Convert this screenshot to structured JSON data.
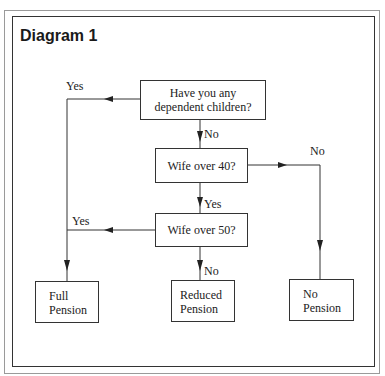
{
  "title": "Diagram 1",
  "nodes": {
    "q1": {
      "line1": "Have you any",
      "line2": "dependent children?"
    },
    "q2": {
      "text": "Wife over 40?"
    },
    "q3": {
      "text": "Wife over 50?"
    },
    "full": {
      "line1": "Full",
      "line2": "Pension"
    },
    "reduced": {
      "line1": "Reduced",
      "line2": "Pension"
    },
    "none": {
      "line1": "No",
      "line2": "Pension"
    }
  },
  "edges": {
    "q1_yes": "Yes",
    "q1_no": "No",
    "q2_no": "No",
    "q2_yes": "Yes",
    "q3_yes": "Yes",
    "q3_no": "No"
  },
  "colors": {
    "line": "#333333",
    "outer_border": "#9a9a9a"
  }
}
